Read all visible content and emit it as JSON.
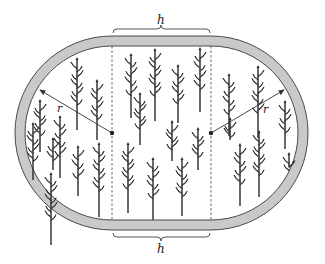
{
  "diagram": {
    "labels": {
      "top_length": "h",
      "bottom_length": "h",
      "left_radius": "r",
      "right_radius": "r"
    },
    "colors": {
      "track_fill": "#c9c9c9",
      "track_stroke": "#4a4a4a",
      "field_fill": "#ffffff",
      "line": "#333333",
      "plant": "#2a2a2a"
    },
    "geometry": {
      "left_center": [
        112,
        133
      ],
      "right_center": [
        211,
        133
      ],
      "outer_radius": 97,
      "inner_radius": 87
    },
    "plants": [
      [
        40,
        102,
        50
      ],
      [
        77,
        60,
        70
      ],
      [
        97,
        82,
        58
      ],
      [
        60,
        118,
        60
      ],
      [
        33,
        125,
        55
      ],
      [
        51,
        175,
        70
      ],
      [
        78,
        148,
        48
      ],
      [
        99,
        145,
        72
      ],
      [
        53,
        140,
        30
      ],
      [
        131,
        56,
        62
      ],
      [
        155,
        51,
        70
      ],
      [
        178,
        67,
        56
      ],
      [
        200,
        50,
        62
      ],
      [
        140,
        95,
        50
      ],
      [
        172,
        123,
        38
      ],
      [
        198,
        130,
        40
      ],
      [
        128,
        145,
        68
      ],
      [
        153,
        160,
        60
      ],
      [
        182,
        160,
        56
      ],
      [
        229,
        76,
        60
      ],
      [
        258,
        68,
        70
      ],
      [
        285,
        103,
        46
      ],
      [
        240,
        146,
        60
      ],
      [
        259,
        133,
        64
      ],
      [
        230,
        120,
        20
      ],
      [
        289,
        155,
        12
      ]
    ]
  }
}
